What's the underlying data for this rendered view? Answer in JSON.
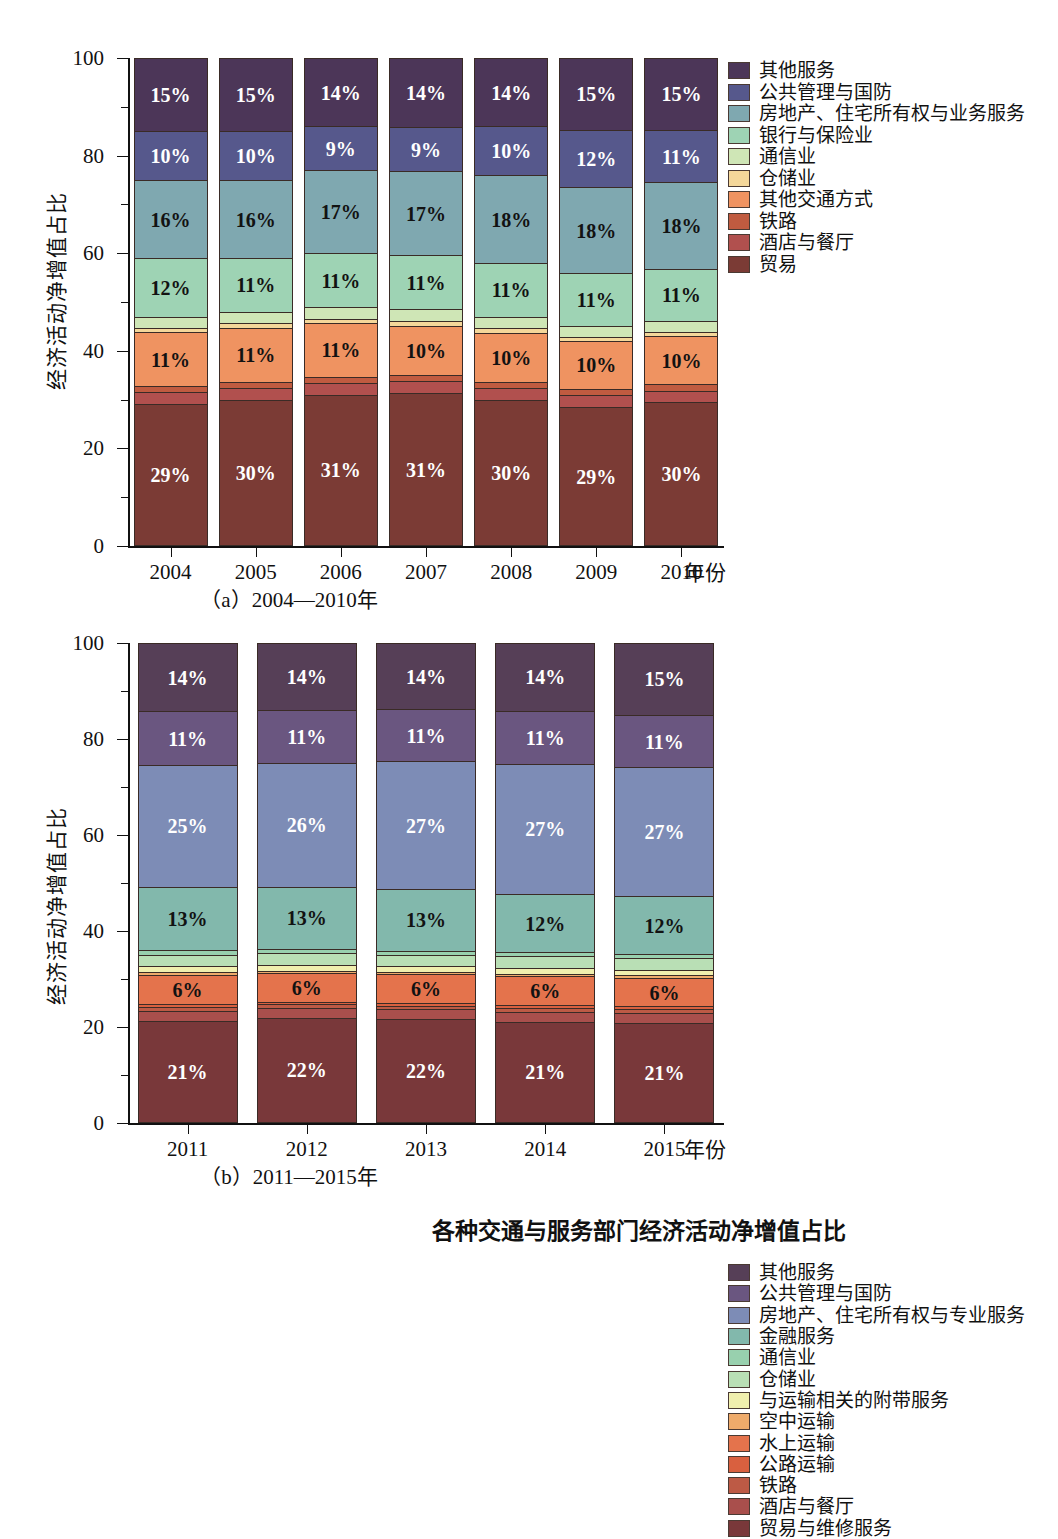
{
  "figure": {
    "y_axis_title": "经济活动净增值占比",
    "x_axis_title": "年份",
    "caption_a": "（a）2004—2010年",
    "caption_b": "（b）2011—2015年",
    "figure_caption": "各种交通与服务部门经济活动净增值占比",
    "yticks": [
      "0",
      "20",
      "40",
      "60",
      "80",
      "100"
    ]
  },
  "chart_data": [
    {
      "type": "bar",
      "id": "panel-a",
      "title": "（a）2004—2010年",
      "stacked": true,
      "normalized_percent": true,
      "xlabel": "年份",
      "ylabel": "经济活动净增值占比",
      "ylim": [
        0,
        100
      ],
      "yticks": [
        0,
        20,
        40,
        60,
        80,
        100
      ],
      "grid": false,
      "legend_position": "right",
      "categories": [
        "2004",
        "2005",
        "2006",
        "2007",
        "2008",
        "2009",
        "2010"
      ],
      "series_order_bottom_to_top": [
        "贸易",
        "酒店与餐厅",
        "铁路",
        "其他交通方式",
        "仓储业",
        "通信业",
        "银行与保险业",
        "房地产、住宅所有权与业务服务",
        "公共管理与国防",
        "其他服务"
      ],
      "series": [
        {
          "name": "贸易",
          "color": "#7b3b35",
          "text": "light",
          "values": [
            29,
            30,
            31,
            31,
            30,
            29,
            30
          ],
          "labels": [
            "29%",
            "30%",
            "31%",
            "31%",
            "30%",
            "29%",
            "30%"
          ]
        },
        {
          "name": "酒店与餐厅",
          "color": "#b1504e",
          "text": "dark",
          "values": [
            2.5,
            2.4,
            2.4,
            2.4,
            2.4,
            2.6,
            2.5
          ],
          "labels": [
            "",
            "",
            "",
            "",
            "",
            "",
            ""
          ]
        },
        {
          "name": "铁路",
          "color": "#c05b40",
          "text": "dark",
          "values": [
            1.3,
            1.3,
            1.3,
            1.3,
            1.3,
            1.3,
            1.3
          ],
          "labels": [
            "",
            "",
            "",
            "",
            "",
            "",
            ""
          ]
        },
        {
          "name": "其他交通方式",
          "color": "#ef9361",
          "text": "dark",
          "values": [
            11,
            11,
            11,
            10,
            10,
            10,
            10
          ],
          "labels": [
            "11%",
            "11%",
            "11%",
            "10%",
            "10%",
            "10%",
            "10%"
          ]
        },
        {
          "name": "仓储业",
          "color": "#f4d79a",
          "text": "dark",
          "values": [
            0.9,
            0.9,
            0.9,
            0.9,
            0.9,
            0.9,
            0.9
          ],
          "labels": [
            "",
            "",
            "",
            "",
            "",
            "",
            ""
          ]
        },
        {
          "name": "通信业",
          "color": "#cfe6b6",
          "text": "dark",
          "values": [
            2.3,
            2.4,
            2.4,
            2.4,
            2.4,
            2.3,
            2.3
          ],
          "labels": [
            "",
            "",
            "",
            "",
            "",
            "",
            ""
          ]
        },
        {
          "name": "银行与保险业",
          "color": "#9ed3b4",
          "text": "dark",
          "values": [
            12,
            11,
            11,
            11,
            11,
            11,
            11
          ],
          "labels": [
            "12%",
            "11%",
            "11%",
            "11%",
            "11%",
            "11%",
            "11%"
          ]
        },
        {
          "name": "房地产、住宅所有权与业务服务",
          "color": "#7fa8b0",
          "text": "dark",
          "values": [
            16,
            16,
            17,
            17,
            18,
            18,
            18
          ],
          "labels": [
            "16%",
            "16%",
            "17%",
            "17%",
            "18%",
            "18%",
            "18%"
          ]
        },
        {
          "name": "公共管理与国防",
          "color": "#56588c",
          "text": "light",
          "values": [
            10,
            10,
            9,
            9,
            10,
            12,
            11
          ],
          "labels": [
            "10%",
            "10%",
            "9%",
            "9%",
            "10%",
            "12%",
            "11%"
          ]
        },
        {
          "name": "其他服务",
          "color": "#4c3658",
          "text": "light",
          "values": [
            15,
            15,
            14,
            14,
            14,
            15,
            15
          ],
          "labels": [
            "15%",
            "15%",
            "14%",
            "14%",
            "14%",
            "15%",
            "15%"
          ]
        }
      ],
      "legend_top_to_bottom": [
        {
          "label": "其他服务",
          "color": "#4c3658"
        },
        {
          "label": "公共管理与国防",
          "color": "#56588c"
        },
        {
          "label": "房地产、住宅所有权与业务服务",
          "color": "#7fa8b0"
        },
        {
          "label": "银行与保险业",
          "color": "#9ed3b4"
        },
        {
          "label": "通信业",
          "color": "#cfe6b6"
        },
        {
          "label": "仓储业",
          "color": "#f4d79a"
        },
        {
          "label": "其他交通方式",
          "color": "#ef9361"
        },
        {
          "label": "铁路",
          "color": "#c05b40"
        },
        {
          "label": "酒店与餐厅",
          "color": "#b1504e"
        },
        {
          "label": "贸易",
          "color": "#7b3b35"
        }
      ]
    },
    {
      "type": "bar",
      "id": "panel-b",
      "title": "（b）2011—2015年",
      "stacked": true,
      "normalized_percent": true,
      "xlabel": "年份",
      "ylabel": "经济活动净增值占比",
      "ylim": [
        0,
        100
      ],
      "yticks": [
        0,
        20,
        40,
        60,
        80,
        100
      ],
      "grid": false,
      "legend_position": "right",
      "categories": [
        "2011",
        "2012",
        "2013",
        "2014",
        "2015"
      ],
      "series_order_bottom_to_top": [
        "贸易与维修服务",
        "酒店与餐厅",
        "铁路",
        "公路运输",
        "水上运输",
        "空中运输",
        "与运输相关的附带服务",
        "仓储业",
        "通信业",
        "金融服务",
        "房地产、住宅所有权与专业服务",
        "公共管理与国防",
        "其他服务"
      ],
      "series": [
        {
          "name": "贸易与维修服务",
          "color": "#79383a",
          "text": "light",
          "values": [
            21,
            22,
            22,
            21,
            21
          ],
          "labels": [
            "21%",
            "22%",
            "22%",
            "21%",
            "21%"
          ]
        },
        {
          "name": "酒店与餐厅",
          "color": "#a94f4c",
          "text": "dark",
          "values": [
            2.0,
            2.0,
            2.0,
            2.0,
            2.0
          ],
          "labels": [
            "",
            "",
            "",
            "",
            ""
          ]
        },
        {
          "name": "铁路",
          "color": "#bd5a45",
          "text": "dark",
          "values": [
            0.8,
            0.8,
            0.8,
            0.8,
            0.8
          ],
          "labels": [
            "",
            "",
            "",
            "",
            ""
          ]
        },
        {
          "name": "公路运输",
          "color": "#d9603f",
          "text": "dark",
          "values": [
            0.6,
            0.6,
            0.6,
            0.6,
            0.6
          ],
          "labels": [
            "",
            "",
            "",
            "",
            ""
          ]
        },
        {
          "name": "水上运输",
          "color": "#e4734c",
          "text": "dark",
          "values": [
            6,
            6,
            6,
            6,
            6
          ],
          "labels": [
            "6%",
            "6%",
            "6%",
            "6%",
            "6%"
          ]
        },
        {
          "name": "空中运输",
          "color": "#eeab6b",
          "text": "dark",
          "values": [
            0.5,
            0.5,
            0.5,
            0.5,
            0.5
          ],
          "labels": [
            "",
            "",
            "",
            "",
            ""
          ]
        },
        {
          "name": "与运输相关的附带服务",
          "color": "#f0efae",
          "text": "dark",
          "values": [
            1.2,
            1.2,
            1.2,
            1.2,
            1.2
          ],
          "labels": [
            "",
            "",
            "",
            "",
            ""
          ]
        },
        {
          "name": "仓储业",
          "color": "#b9dfb5",
          "text": "dark",
          "values": [
            2.4,
            2.4,
            2.4,
            2.4,
            2.4
          ],
          "labels": [
            "",
            "",
            "",
            "",
            ""
          ]
        },
        {
          "name": "通信业",
          "color": "#98d0ae",
          "text": "dark",
          "values": [
            0.9,
            0.9,
            0.9,
            0.9,
            0.9
          ],
          "labels": [
            "",
            "",
            "",
            "",
            ""
          ]
        },
        {
          "name": "金融服务",
          "color": "#82b8ac",
          "text": "dark",
          "values": [
            13,
            13,
            13,
            12,
            12
          ],
          "labels": [
            "13%",
            "13%",
            "13%",
            "12%",
            "12%"
          ]
        },
        {
          "name": "房地产、住宅所有权与专业服务",
          "color": "#7d8cb6",
          "text": "light",
          "values": [
            25,
            26,
            27,
            27,
            27
          ],
          "labels": [
            "25%",
            "26%",
            "27%",
            "27%",
            "27%"
          ]
        },
        {
          "name": "公共管理与国防",
          "color": "#6a5680",
          "text": "light",
          "values": [
            11,
            11,
            11,
            11,
            11
          ],
          "labels": [
            "11%",
            "11%",
            "11%",
            "11%",
            "11%"
          ]
        },
        {
          "name": "其他服务",
          "color": "#563f57",
          "text": "light",
          "values": [
            14,
            14,
            14,
            14,
            15
          ],
          "labels": [
            "14%",
            "14%",
            "14%",
            "14%",
            "15%"
          ]
        }
      ],
      "legend_top_to_bottom": [
        {
          "label": "其他服务",
          "color": "#563f57"
        },
        {
          "label": "公共管理与国防",
          "color": "#6a5680"
        },
        {
          "label": "房地产、住宅所有权与专业服务",
          "color": "#7d8cb6"
        },
        {
          "label": "金融服务",
          "color": "#82b8ac"
        },
        {
          "label": "通信业",
          "color": "#98d0ae"
        },
        {
          "label": "仓储业",
          "color": "#b9dfb5"
        },
        {
          "label": "与运输相关的附带服务",
          "color": "#f0efae"
        },
        {
          "label": "空中运输",
          "color": "#eeab6b"
        },
        {
          "label": "水上运输",
          "color": "#e4734c"
        },
        {
          "label": "公路运输",
          "color": "#d9603f"
        },
        {
          "label": "铁路",
          "color": "#bd5a45"
        },
        {
          "label": "酒店与餐厅",
          "color": "#a94f4c"
        },
        {
          "label": "贸易与维修服务",
          "color": "#79383a"
        }
      ]
    }
  ]
}
